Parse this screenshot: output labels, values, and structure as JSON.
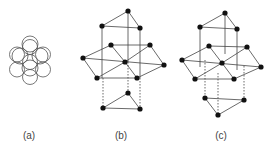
{
  "labels": {
    "a": "(a)",
    "b": "(b)",
    "c": "(c)"
  },
  "colors": {
    "node": "#111111",
    "line": "#444444",
    "circle": "#555555"
  }
}
